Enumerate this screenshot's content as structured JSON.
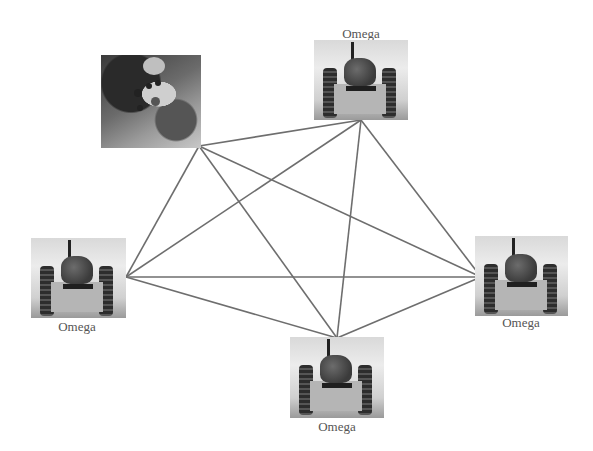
{
  "diagram": {
    "type": "fully-connected network",
    "edge_color": "#6e6e6e",
    "nodes": [
      {
        "id": "controller",
        "kind": "controller-photo",
        "label": "",
        "hub": [
          199,
          146
        ]
      },
      {
        "id": "robot-top",
        "kind": "robot",
        "label": "Omega",
        "label_position": "above",
        "hub": [
          361,
          120
        ]
      },
      {
        "id": "robot-left",
        "kind": "robot",
        "label": "Omega",
        "label_position": "below",
        "hub": [
          126,
          277
        ]
      },
      {
        "id": "robot-right",
        "kind": "robot",
        "label": "Omega",
        "label_position": "below",
        "hub": [
          481,
          277
        ]
      },
      {
        "id": "robot-bottom",
        "kind": "robot",
        "label": "Omega",
        "label_position": "below",
        "hub": [
          337,
          338
        ]
      }
    ],
    "edges": [
      [
        "controller",
        "robot-top"
      ],
      [
        "controller",
        "robot-left"
      ],
      [
        "controller",
        "robot-right"
      ],
      [
        "controller",
        "robot-bottom"
      ],
      [
        "robot-top",
        "robot-left"
      ],
      [
        "robot-top",
        "robot-right"
      ],
      [
        "robot-top",
        "robot-bottom"
      ],
      [
        "robot-left",
        "robot-right"
      ],
      [
        "robot-left",
        "robot-bottom"
      ],
      [
        "robot-right",
        "robot-bottom"
      ]
    ]
  },
  "labels": {
    "top": "Omega",
    "left": "Omega",
    "right": "Omega",
    "bottom": "Omega"
  }
}
